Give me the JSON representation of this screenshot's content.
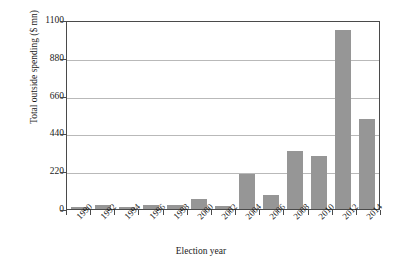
{
  "chart_data": {
    "type": "bar",
    "title": "",
    "xlabel": "Election year",
    "ylabel": "Total outside spending ($ mn)",
    "categories": [
      "1990",
      "1992",
      "1994",
      "1996",
      "1998",
      "2000",
      "2002",
      "2004",
      "2006",
      "2008",
      "2010",
      "2012",
      "2014"
    ],
    "values": [
      12,
      25,
      14,
      24,
      22,
      60,
      18,
      205,
      80,
      340,
      310,
      1040,
      525
    ],
    "ylim": [
      0,
      1100
    ],
    "yticks": [
      0,
      220,
      440,
      660,
      880,
      1100
    ],
    "ytick_labels": [
      "0",
      "220",
      "440",
      "660",
      "880",
      "1100"
    ],
    "grid": "horizontal",
    "legend": "none",
    "bar_color": "#969696",
    "frame_color": "#4a4a4a",
    "grid_color": "#b9b9b9",
    "background": "#ffffff"
  }
}
